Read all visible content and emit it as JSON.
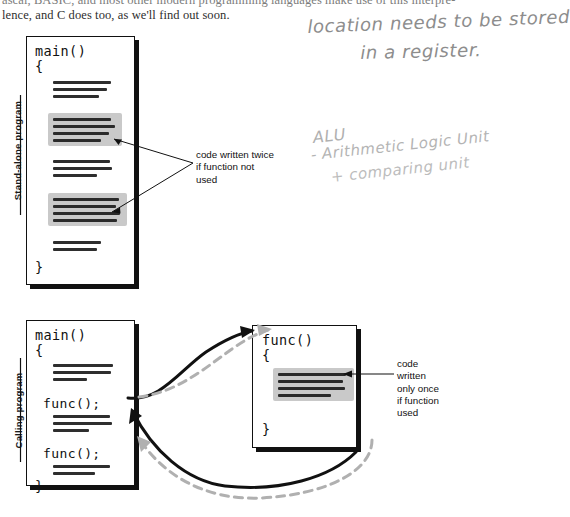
{
  "page": {
    "width": 547,
    "height": 517,
    "background": "#ffffff"
  },
  "book_text": {
    "line1": "ascal, BASIC, and most other modern programming languages make use of this interpre-",
    "line2": "lence, and C does too, as we'll find out soon."
  },
  "handwritten_notes": [
    {
      "name": "location-register-note-line1",
      "text": "location needs to be stored"
    },
    {
      "name": "location-register-note-line2",
      "text": "in a register."
    },
    {
      "name": "alu-note-line1",
      "text": "ALU"
    },
    {
      "name": "alu-note-line2",
      "text": "- Arithmetic Logic Unit"
    },
    {
      "name": "alu-note-line3",
      "text": "+    comparing unit"
    }
  ],
  "section_labels": {
    "standalone": "Stand-alone program",
    "calling": "Calling program"
  },
  "standalone_box": {
    "title": "main()",
    "open_brace": "{",
    "close_brace": "}",
    "blocks": [
      {
        "name": "plain-code-block-1",
        "shaded": false,
        "lines": 3
      },
      {
        "name": "shaded-code-block-1",
        "shaded": true,
        "lines": 4
      },
      {
        "name": "plain-code-block-2",
        "shaded": false,
        "lines": 3
      },
      {
        "name": "shaded-code-block-2",
        "shaded": true,
        "lines": 4
      },
      {
        "name": "plain-code-block-3",
        "shaded": false,
        "lines": 2
      }
    ]
  },
  "calling_box": {
    "title": "main()",
    "open_brace": "{",
    "close_brace": "}",
    "call_1": "func();",
    "call_2": "func();",
    "blocks": [
      {
        "name": "plain-code-block-1",
        "shaded": false,
        "lines": 3
      },
      {
        "name": "plain-code-block-2",
        "shaded": false,
        "lines": 3
      },
      {
        "name": "plain-code-block-3",
        "shaded": false,
        "lines": 2
      }
    ]
  },
  "func_box": {
    "title": "func()",
    "open_brace": "{",
    "close_brace": "}",
    "blocks": [
      {
        "name": "shaded-code-block-1",
        "shaded": true,
        "lines": 4
      }
    ]
  },
  "callouts": {
    "written_twice": {
      "line1": "code written twice",
      "line2": "if function not",
      "line3": "used"
    },
    "written_once": {
      "line1": "code",
      "line2": "written",
      "line3": "only once",
      "line4": "if function",
      "line5": "used"
    }
  },
  "colors": {
    "ink": "#111111",
    "shade": "#c9c9c9",
    "dashed_arrow": "#b0b0b0",
    "handwriting": "#8d8d8d",
    "paper": "#ffffff"
  },
  "arrows": {
    "call_arrows_style": "solid-black",
    "return_arrows_style": "gray-dashed"
  }
}
